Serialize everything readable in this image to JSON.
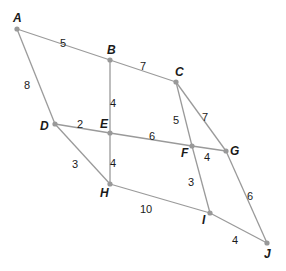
{
  "graph": {
    "nodes": [
      {
        "id": "A",
        "x": 17,
        "y": 29,
        "lx": 13,
        "ly": 22
      },
      {
        "id": "B",
        "x": 110,
        "y": 60,
        "lx": 107,
        "ly": 54
      },
      {
        "id": "C",
        "x": 176,
        "y": 82,
        "lx": 175,
        "ly": 76
      },
      {
        "id": "D",
        "x": 55,
        "y": 124,
        "lx": 40,
        "ly": 130
      },
      {
        "id": "E",
        "x": 110,
        "y": 133,
        "lx": 100,
        "ly": 128
      },
      {
        "id": "F",
        "x": 192,
        "y": 146,
        "lx": 181,
        "ly": 157
      },
      {
        "id": "G",
        "x": 226,
        "y": 151,
        "lx": 230,
        "ly": 155
      },
      {
        "id": "H",
        "x": 110,
        "y": 184,
        "lx": 100,
        "ly": 197
      },
      {
        "id": "I",
        "x": 210,
        "y": 213,
        "lx": 202,
        "ly": 224
      },
      {
        "id": "J",
        "x": 267,
        "y": 243,
        "lx": 264,
        "ly": 258
      }
    ],
    "edges": [
      {
        "from": "A",
        "to": "B",
        "weight": "5",
        "wx": 63,
        "wy": 44
      },
      {
        "from": "B",
        "to": "C",
        "weight": "7",
        "wx": 143,
        "wy": 67
      },
      {
        "from": "A",
        "to": "D",
        "weight": "8",
        "wx": 27,
        "wy": 86
      },
      {
        "from": "B",
        "to": "E",
        "weight": "4",
        "wx": 113,
        "wy": 104
      },
      {
        "from": "D",
        "to": "E",
        "weight": "2",
        "wx": 80,
        "wy": 125
      },
      {
        "from": "E",
        "to": "F",
        "weight": "6",
        "wx": 152,
        "wy": 137
      },
      {
        "from": "F",
        "to": "G",
        "weight": "4",
        "wx": 207,
        "wy": 158
      },
      {
        "from": "C",
        "to": "F",
        "weight": "5",
        "wx": 176,
        "wy": 121
      },
      {
        "from": "C",
        "to": "G",
        "weight": "7",
        "wx": 205,
        "wy": 118
      },
      {
        "from": "D",
        "to": "H",
        "weight": "3",
        "wx": 75,
        "wy": 165
      },
      {
        "from": "E",
        "to": "H",
        "weight": "4",
        "wx": 113,
        "wy": 164
      },
      {
        "from": "F",
        "to": "I",
        "weight": "3",
        "wx": 191,
        "wy": 183
      },
      {
        "from": "H",
        "to": "I",
        "weight": "10",
        "wx": 146,
        "wy": 210
      },
      {
        "from": "G",
        "to": "J",
        "weight": "6",
        "wx": 250,
        "wy": 197
      },
      {
        "from": "I",
        "to": "J",
        "weight": "4",
        "wx": 235,
        "wy": 241
      }
    ]
  }
}
